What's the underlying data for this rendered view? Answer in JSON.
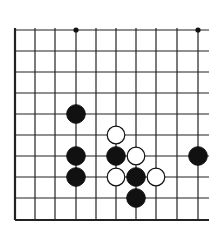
{
  "board": {
    "cols_x": [
      15,
      35,
      55,
      76,
      96,
      116,
      136,
      156,
      177,
      198
    ],
    "rows_y": [
      30,
      51,
      72,
      93,
      114,
      135,
      156,
      177,
      198,
      220
    ],
    "right_open_edge_x": 209,
    "left_edge": "thick",
    "bottom_edge": "thick",
    "line_color": "#222222",
    "star_points": [
      [
        3,
        0
      ],
      [
        9,
        0
      ]
    ],
    "stones": [
      {
        "color": "black",
        "col": 3,
        "row": 4
      },
      {
        "color": "white",
        "col": 5,
        "row": 5
      },
      {
        "color": "black",
        "col": 3,
        "row": 6
      },
      {
        "color": "black",
        "col": 5,
        "row": 6
      },
      {
        "color": "white",
        "col": 6,
        "row": 6
      },
      {
        "color": "black",
        "col": 9,
        "row": 6
      },
      {
        "color": "black",
        "col": 3,
        "row": 7
      },
      {
        "color": "white",
        "col": 5,
        "row": 7
      },
      {
        "color": "black",
        "col": 6,
        "row": 7
      },
      {
        "color": "white",
        "col": 7,
        "row": 7
      },
      {
        "color": "black",
        "col": 6,
        "row": 8
      }
    ]
  }
}
